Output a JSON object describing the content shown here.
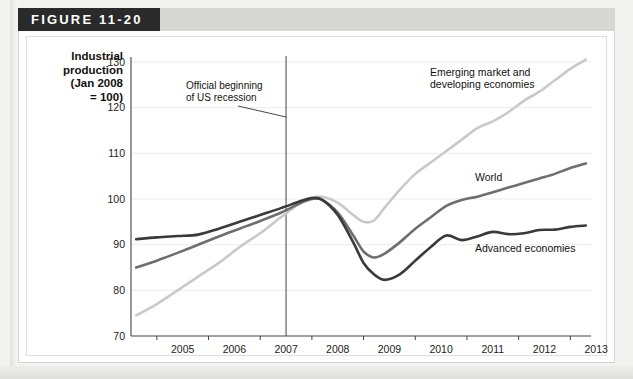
{
  "figure": {
    "header_label": "FIGURE 11-20"
  },
  "axis_title": {
    "line1": "Industrial",
    "line2": "production",
    "line3": "(Jan 2008",
    "line4": "= 100)"
  },
  "annotation": {
    "line1": "Official beginning",
    "line2": "of US recession",
    "at_year": 2007.5
  },
  "chart_data": {
    "type": "line",
    "title": "",
    "xlabel": "",
    "ylabel": "Industrial production (Jan 2008 = 100)",
    "xlim": [
      2004.5,
      2013.4
    ],
    "ylim": [
      70,
      130
    ],
    "yticks": [
      70,
      80,
      90,
      100,
      110,
      120,
      130
    ],
    "xticks": [
      2005,
      2006,
      2007,
      2008,
      2009,
      2010,
      2011,
      2012,
      2013
    ],
    "xtick_labels": [
      "2005",
      "2006",
      "2007",
      "2008",
      "2009",
      "2010",
      "2011",
      "2012",
      "2013"
    ],
    "ytick_labels": [
      "70",
      "80",
      "90",
      "100",
      "110",
      "120",
      "130"
    ],
    "grid": "horizontal",
    "legend": "inline-labels",
    "colors": {
      "emerging": "#c9c9c9",
      "world": "#6e6e6e",
      "advanced": "#3a3a3a",
      "recession_line": "#555555",
      "gridline": "#ececec",
      "axis": "#444444"
    },
    "x": [
      2004.6,
      2005.0,
      2005.4,
      2005.8,
      2006.2,
      2006.6,
      2007.0,
      2007.4,
      2007.8,
      2008.0,
      2008.2,
      2008.5,
      2008.8,
      2009.0,
      2009.2,
      2009.4,
      2009.7,
      2010.0,
      2010.3,
      2010.6,
      2010.9,
      2011.2,
      2011.5,
      2011.8,
      2012.1,
      2012.4,
      2012.7,
      2013.0,
      2013.3
    ],
    "series": [
      {
        "name": "Emerging market and developing economies",
        "key": "emerging",
        "label": "Emerging market and\ndeveloping economies",
        "label_line1": "Emerging market and",
        "label_line2": "developing economies",
        "color": "#c9c9c9",
        "values": [
          74.5,
          77.0,
          80.0,
          83.0,
          86.0,
          89.5,
          92.5,
          96.0,
          99.3,
          100.3,
          100.5,
          99.2,
          96.5,
          95.0,
          95.3,
          98.0,
          102.0,
          105.5,
          108.0,
          110.5,
          113.0,
          115.5,
          117.0,
          119.0,
          121.5,
          123.5,
          126.0,
          128.5,
          130.5
        ]
      },
      {
        "name": "World",
        "key": "world",
        "label": "World",
        "color": "#6e6e6e",
        "values": [
          85.0,
          86.5,
          88.2,
          90.0,
          91.8,
          93.5,
          95.2,
          97.0,
          99.2,
          100.0,
          99.8,
          97.0,
          92.0,
          88.5,
          87.2,
          88.0,
          90.5,
          93.5,
          96.0,
          98.5,
          99.8,
          100.5,
          101.5,
          102.5,
          103.5,
          104.5,
          105.5,
          106.8,
          107.8
        ]
      },
      {
        "name": "Advanced economies",
        "key": "advanced",
        "label": "Advanced economies",
        "color": "#3a3a3a",
        "values": [
          91.2,
          91.6,
          91.9,
          92.2,
          93.5,
          95.0,
          96.5,
          98.0,
          99.6,
          100.2,
          99.8,
          96.5,
          90.5,
          86.0,
          83.5,
          82.3,
          83.5,
          86.5,
          89.5,
          92.0,
          91.0,
          91.8,
          92.8,
          92.3,
          92.5,
          93.2,
          93.3,
          93.9,
          94.2
        ]
      }
    ]
  }
}
